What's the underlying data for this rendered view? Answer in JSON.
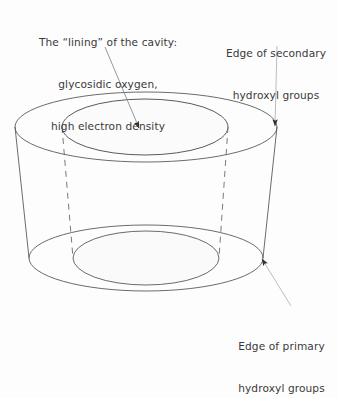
{
  "figure": {
    "background_color": "#fdfdfd",
    "line_color": "#5a5a5a",
    "text_color": "#3a3a3a",
    "cavity_fill_color": "#fbfbfb"
  },
  "labels": {
    "cavity": {
      "line1": "The “lining” of the cavity:",
      "line2": "glycosidic oxygen,",
      "line3": "high electron density"
    },
    "secondary_edge": {
      "line1": "Edge of secondary",
      "line2": "hydroxyl groups"
    },
    "primary_edge": {
      "line1": "Edge of primary",
      "line2": "hydroxyl groups"
    }
  },
  "annotations": {
    "cavity_leader": {
      "from_x": 105,
      "from_y": 47,
      "to_x": 139,
      "to_y": 128,
      "arrowhead": "filled-triangle"
    },
    "secondary_leader": {
      "from_x": 277,
      "from_y": 46,
      "to_x": 275,
      "to_y": 126,
      "arrowhead": "filled-triangle"
    },
    "primary_leader": {
      "from_x": 291,
      "from_y": 306,
      "to_x": 262,
      "to_y": 259,
      "arrowhead": "filled-triangle"
    }
  },
  "geometry": {
    "top_outer_ellipse": {
      "cx": 146,
      "cy": 127,
      "rx": 131,
      "ry": 35
    },
    "top_inner_ellipse": {
      "cx": 145,
      "cy": 127,
      "rx": 83,
      "ry": 28
    },
    "bottom_outer_ellipse": {
      "cx": 146,
      "cy": 258,
      "rx": 117,
      "ry": 33
    },
    "bottom_inner_ellipse": {
      "cx": 146,
      "cy": 258,
      "rx": 73,
      "ry": 27
    },
    "left_wall": {
      "x1": 15,
      "y1": 127,
      "x2": 29,
      "y2": 258
    },
    "right_wall": {
      "x1": 277,
      "y1": 127,
      "x2": 263,
      "y2": 258
    },
    "inner_wall_left_dashed": {
      "x1": 62,
      "y1": 127,
      "x2": 73,
      "y2": 258
    },
    "inner_wall_right_dashed": {
      "x1": 228,
      "y1": 127,
      "x2": 219,
      "y2": 258
    }
  }
}
